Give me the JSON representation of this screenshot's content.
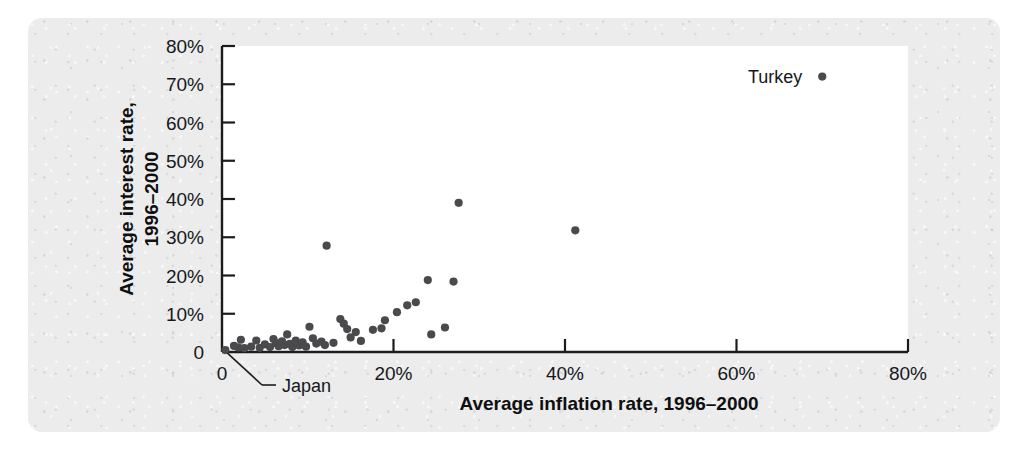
{
  "figure": {
    "name": "inflation-interest-scatter",
    "background_color": "#ececec",
    "plot_background_color": "#ffffff",
    "point_color": "#4a4a4d",
    "axis_color": "#1a1c1f"
  },
  "chart_data": {
    "type": "scatter",
    "title": "",
    "xlabel": "Average inflation rate, 1996–2000",
    "ylabel_line1": "Average interest rate,",
    "ylabel_line2": "1996–2000",
    "ylabel": "Average interest rate, 1996–2000",
    "xlim": [
      0,
      80
    ],
    "ylim": [
      0,
      80
    ],
    "x_unit": "percent",
    "y_unit": "percent",
    "grid": false,
    "legend": false,
    "x_ticks": [
      0,
      20,
      40,
      60,
      80
    ],
    "x_tick_labels": [
      "0",
      "20%",
      "40%",
      "60%",
      "80%"
    ],
    "y_ticks": [
      0,
      10,
      20,
      30,
      40,
      50,
      60,
      70,
      80
    ],
    "y_tick_labels": [
      "0",
      "10%",
      "20%",
      "30%",
      "40%",
      "50%",
      "60%",
      "70%",
      "80%"
    ],
    "y_minor_ticks": [
      10,
      20,
      30,
      40,
      50,
      60,
      70,
      80
    ],
    "annotations": [
      {
        "text": "Turkey",
        "x": 70.0,
        "y": 72.0,
        "label_position": "left"
      },
      {
        "text": "Japan",
        "x": 0.4,
        "y": 0.5,
        "label_position": "below-left-with-leader"
      }
    ],
    "points": [
      {
        "x": 0.4,
        "y": 0.5
      },
      {
        "x": 1.4,
        "y": 1.6
      },
      {
        "x": 1.9,
        "y": 1.2
      },
      {
        "x": 2.2,
        "y": 3.2
      },
      {
        "x": 2.6,
        "y": 1.0
      },
      {
        "x": 3.4,
        "y": 1.4
      },
      {
        "x": 4.0,
        "y": 3.0
      },
      {
        "x": 4.4,
        "y": 1.1
      },
      {
        "x": 5.0,
        "y": 2.0
      },
      {
        "x": 5.6,
        "y": 1.3
      },
      {
        "x": 6.0,
        "y": 3.4
      },
      {
        "x": 6.3,
        "y": 2.3
      },
      {
        "x": 6.6,
        "y": 1.5
      },
      {
        "x": 7.0,
        "y": 2.8
      },
      {
        "x": 7.3,
        "y": 1.8
      },
      {
        "x": 7.6,
        "y": 4.6
      },
      {
        "x": 7.9,
        "y": 2.1
      },
      {
        "x": 8.2,
        "y": 1.3
      },
      {
        "x": 8.6,
        "y": 3.0
      },
      {
        "x": 9.0,
        "y": 1.7
      },
      {
        "x": 9.4,
        "y": 2.5
      },
      {
        "x": 9.8,
        "y": 1.4
      },
      {
        "x": 10.2,
        "y": 6.6
      },
      {
        "x": 10.6,
        "y": 3.6
      },
      {
        "x": 11.0,
        "y": 2.2
      },
      {
        "x": 11.6,
        "y": 2.7
      },
      {
        "x": 12.0,
        "y": 1.8
      },
      {
        "x": 12.2,
        "y": 27.8
      },
      {
        "x": 13.0,
        "y": 2.4
      },
      {
        "x": 13.8,
        "y": 8.6
      },
      {
        "x": 14.2,
        "y": 7.4
      },
      {
        "x": 14.6,
        "y": 6.0
      },
      {
        "x": 15.0,
        "y": 3.8
      },
      {
        "x": 15.6,
        "y": 5.2
      },
      {
        "x": 16.2,
        "y": 2.9
      },
      {
        "x": 17.6,
        "y": 5.8
      },
      {
        "x": 18.6,
        "y": 6.2
      },
      {
        "x": 19.0,
        "y": 8.3
      },
      {
        "x": 20.4,
        "y": 10.4
      },
      {
        "x": 21.6,
        "y": 12.2
      },
      {
        "x": 22.6,
        "y": 13.0
      },
      {
        "x": 24.0,
        "y": 18.8
      },
      {
        "x": 24.4,
        "y": 4.6
      },
      {
        "x": 26.0,
        "y": 6.4
      },
      {
        "x": 27.0,
        "y": 18.4
      },
      {
        "x": 27.6,
        "y": 39.0
      },
      {
        "x": 41.2,
        "y": 31.8
      },
      {
        "x": 70.0,
        "y": 72.0
      }
    ]
  }
}
